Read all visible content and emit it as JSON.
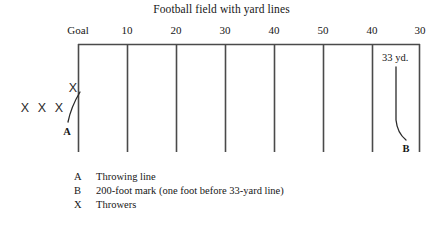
{
  "figure": {
    "title": "Football field with yard lines",
    "width": 443,
    "height": 225,
    "background_color": "#ffffff",
    "line_color": "#4a4a4a",
    "text_color": "#161616"
  },
  "field": {
    "yard_labels": [
      "Goal",
      "10",
      "20",
      "30",
      "40",
      "50",
      "40",
      "30"
    ],
    "yard_line_x": [
      78,
      127,
      176,
      225,
      274,
      323,
      372,
      420
    ],
    "top_y": 44,
    "bottom_y": 152
  },
  "annotations": {
    "throwing_line_label": "A",
    "mark_label": "B",
    "distance_label": "33 yd.",
    "thrower_marks": [
      "X",
      "X",
      "X",
      "X"
    ],
    "thrower_positions": [
      {
        "x": 25,
        "y": 108
      },
      {
        "x": 42,
        "y": 108
      },
      {
        "x": 59,
        "y": 108
      },
      {
        "x": 73,
        "y": 88
      }
    ]
  },
  "legend": {
    "rows": [
      {
        "key": "A",
        "desc": "Throwing line"
      },
      {
        "key": "B",
        "desc": "200-foot mark (one foot before 33-yard line)"
      },
      {
        "key": "X",
        "desc": "Throwers"
      }
    ]
  }
}
